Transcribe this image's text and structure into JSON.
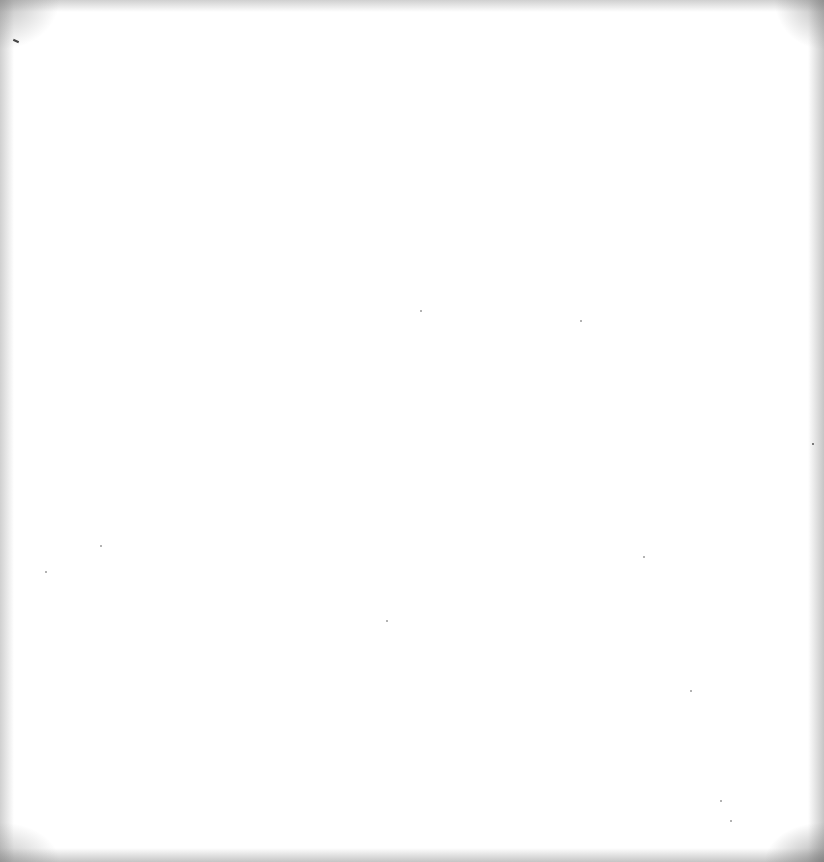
{
  "page": {
    "type": "blank-scanned-page",
    "text_content": []
  }
}
